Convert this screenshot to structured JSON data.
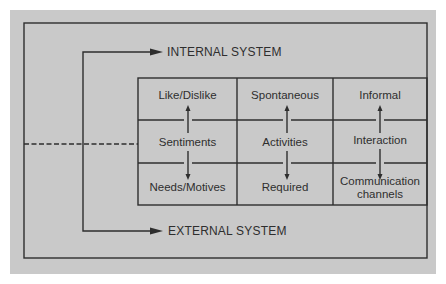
{
  "diagram": {
    "internal_label": "INTERNAL SYSTEM",
    "external_label": "EXTERNAL SYSTEM",
    "columns": [
      {
        "top": "Like/Dislike",
        "middle": "Sentiments",
        "bottom": "Needs/Motives"
      },
      {
        "top": "Spontaneous",
        "middle": "Activities",
        "bottom": "Required"
      },
      {
        "top": "Informal",
        "middle": "Interaction",
        "bottom_line1": "Communication",
        "bottom_line2": "channels"
      }
    ],
    "colors": {
      "background": "#c9c9c9",
      "ink": "#2e2e2e"
    }
  }
}
